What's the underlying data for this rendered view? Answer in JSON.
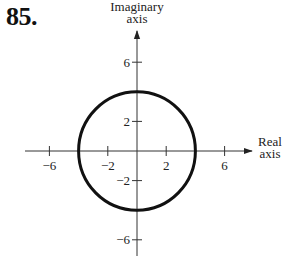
{
  "problem_number": "85.",
  "chart_data": {
    "type": "line",
    "title": "",
    "xlabel": "Real axis",
    "ylabel": "Imaginary axis",
    "xlabel_lines": [
      "Real",
      "axis"
    ],
    "ylabel_lines": [
      "Imaginary",
      "axis"
    ],
    "xlim": [
      -7.5,
      7.8
    ],
    "ylim": [
      -7,
      8
    ],
    "x_ticks": [
      -6,
      -2,
      2,
      6
    ],
    "y_ticks": [
      6,
      2,
      -2,
      -6
    ],
    "x_tick_labels": [
      "-6",
      "-2",
      "2",
      "6"
    ],
    "y_tick_labels": [
      "6",
      "2",
      "-2",
      "-6"
    ],
    "grid": false,
    "series": [
      {
        "name": "circle",
        "shape": "circle",
        "center": [
          0,
          0
        ],
        "radius": 4
      }
    ]
  }
}
